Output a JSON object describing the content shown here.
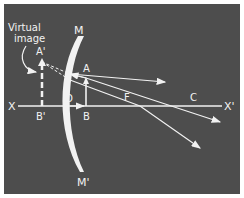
{
  "diagram": {
    "colors": {
      "background": "#4d4d4d",
      "border": "#ffffff",
      "lines": "#f2f2f2"
    },
    "annotation": {
      "line1": "Virtual",
      "line2": "image"
    },
    "labels": {
      "mirror_top": "M",
      "mirror_bottom": "M'",
      "axis_left": "X",
      "axis_right": "X'",
      "image_top": "A'",
      "image_base": "B'",
      "object_top": "A",
      "object_base": "B",
      "pole": "O",
      "focus": "F",
      "center": "C"
    }
  }
}
